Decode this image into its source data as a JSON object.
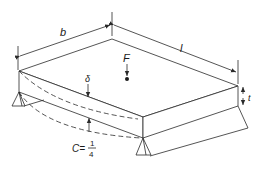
{
  "diagram": {
    "type": "plate-bending-isometric",
    "labels": {
      "width": "b",
      "length": "l",
      "force": "F",
      "deflection": "δ",
      "thickness": "t",
      "constant_prefix": "C=",
      "constant_numerator": "1",
      "constant_denominator": "4"
    },
    "colors": {
      "line": "#2a2a2a",
      "text": "#1a1a1a",
      "background": "#ffffff"
    }
  }
}
